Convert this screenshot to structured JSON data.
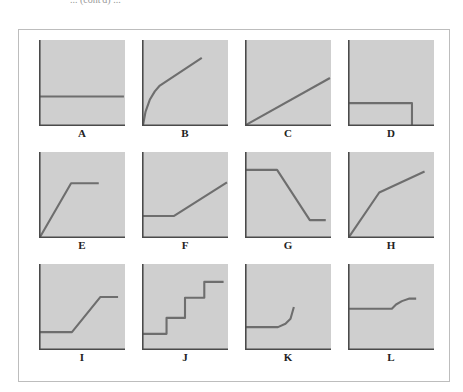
{
  "header": {
    "caption_fragment": "... (cont'd) ..."
  },
  "style": {
    "panel_fill": "#cfcfcf",
    "axis_color": "#4a4a4a",
    "curve_color": "#6e6e6e",
    "frame_color": "#bdbdbd"
  },
  "panels": [
    {
      "label": "A",
      "shape": "flat horizontal line",
      "points": [
        [
          0,
          34
        ],
        [
          100,
          34
        ]
      ]
    },
    {
      "label": "B",
      "shape": "steep concave rise from origin then shallower linear rise",
      "points": [
        [
          0,
          0
        ],
        [
          3,
          16
        ],
        [
          8,
          30
        ],
        [
          14,
          40
        ],
        [
          20,
          47
        ],
        [
          70,
          80
        ]
      ]
    },
    {
      "label": "C",
      "shape": "straight line rising from origin",
      "points": [
        [
          0,
          0
        ],
        [
          100,
          56
        ]
      ]
    },
    {
      "label": "D",
      "shape": "flat line then vertical drop to zero",
      "points": [
        [
          0,
          26
        ],
        [
          75,
          26
        ],
        [
          75,
          0
        ]
      ]
    },
    {
      "label": "E",
      "shape": "linear rise from origin then plateau",
      "points": [
        [
          0,
          0
        ],
        [
          37,
          64
        ],
        [
          70,
          64
        ]
      ]
    },
    {
      "label": "F",
      "shape": "flat then linear rise",
      "points": [
        [
          0,
          25
        ],
        [
          37,
          25
        ],
        [
          100,
          65
        ]
      ]
    },
    {
      "label": "G",
      "shape": "flat high, linear fall, flat low",
      "points": [
        [
          0,
          80
        ],
        [
          37,
          80
        ],
        [
          76,
          20
        ],
        [
          95,
          20
        ]
      ]
    },
    {
      "label": "H",
      "shape": "steep linear rise then shallower linear rise",
      "points": [
        [
          0,
          0
        ],
        [
          36,
          53
        ],
        [
          90,
          78
        ]
      ]
    },
    {
      "label": "I",
      "shape": "flat low, linear rise, flat high (sigmoid-like ramp)",
      "points": [
        [
          0,
          20
        ],
        [
          38,
          20
        ],
        [
          72,
          62
        ],
        [
          93,
          62
        ]
      ]
    },
    {
      "label": "J",
      "shape": "staircase of discrete steps",
      "points": [
        [
          0,
          18
        ],
        [
          28,
          18
        ],
        [
          28,
          37
        ],
        [
          50,
          37
        ],
        [
          50,
          61
        ],
        [
          73,
          61
        ],
        [
          73,
          80
        ],
        [
          96,
          80
        ]
      ]
    },
    {
      "label": "K",
      "shape": "flat then accelerating rise (cut off)",
      "points": [
        [
          0,
          26
        ],
        [
          38,
          26
        ],
        [
          47,
          30
        ],
        [
          53,
          36
        ],
        [
          57,
          50
        ]
      ]
    },
    {
      "label": "L",
      "shape": "flat then gentle rise leveling off",
      "points": [
        [
          0,
          48
        ],
        [
          51,
          48
        ],
        [
          56,
          53
        ],
        [
          63,
          57
        ],
        [
          72,
          60
        ],
        [
          80,
          60
        ]
      ]
    }
  ],
  "chart_data": {
    "type": "line",
    "title": "",
    "layout": {
      "grid": "3 rows x 4 columns",
      "axes": "unlabeled x and y axes per panel, no ticks",
      "legend": "none"
    },
    "xlim": [
      0,
      100
    ],
    "ylim": [
      0,
      100
    ],
    "series": [
      {
        "name": "A",
        "x": [
          0,
          100
        ],
        "y": [
          34,
          34
        ]
      },
      {
        "name": "B",
        "x": [
          0,
          3,
          8,
          14,
          20,
          70
        ],
        "y": [
          0,
          16,
          30,
          40,
          47,
          80
        ]
      },
      {
        "name": "C",
        "x": [
          0,
          100
        ],
        "y": [
          0,
          56
        ]
      },
      {
        "name": "D",
        "x": [
          0,
          75,
          75
        ],
        "y": [
          26,
          26,
          0
        ]
      },
      {
        "name": "E",
        "x": [
          0,
          37,
          70
        ],
        "y": [
          0,
          64,
          64
        ]
      },
      {
        "name": "F",
        "x": [
          0,
          37,
          100
        ],
        "y": [
          25,
          25,
          65
        ]
      },
      {
        "name": "G",
        "x": [
          0,
          37,
          76,
          95
        ],
        "y": [
          80,
          80,
          20,
          20
        ]
      },
      {
        "name": "H",
        "x": [
          0,
          36,
          90
        ],
        "y": [
          0,
          53,
          78
        ]
      },
      {
        "name": "I",
        "x": [
          0,
          38,
          72,
          93
        ],
        "y": [
          20,
          20,
          62,
          62
        ]
      },
      {
        "name": "J",
        "x": [
          0,
          28,
          28,
          50,
          50,
          73,
          73,
          96
        ],
        "y": [
          18,
          18,
          37,
          37,
          61,
          61,
          80,
          80
        ]
      },
      {
        "name": "K",
        "x": [
          0,
          38,
          47,
          53,
          57
        ],
        "y": [
          26,
          26,
          30,
          36,
          50
        ]
      },
      {
        "name": "L",
        "x": [
          0,
          51,
          56,
          63,
          72,
          80
        ],
        "y": [
          48,
          48,
          53,
          57,
          60,
          60
        ]
      }
    ]
  }
}
